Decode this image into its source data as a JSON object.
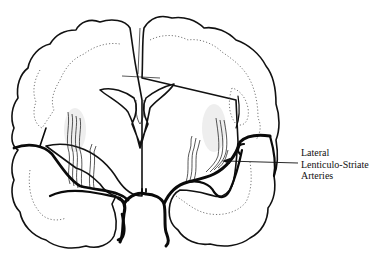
{
  "figure": {
    "colors": {
      "ink": "#111111",
      "background": "#ffffff"
    }
  },
  "labels": [
    {
      "id": "lateral-lenticulo-striate-arteries",
      "lines": [
        "Lateral",
        "Lenticulo-Striate",
        "Arteries"
      ],
      "arrow_target": "right lenticulo-striate arteries"
    }
  ]
}
